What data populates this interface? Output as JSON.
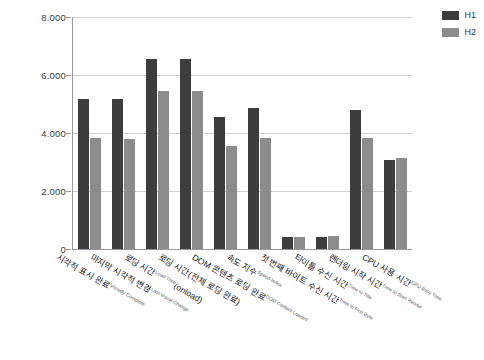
{
  "chart_data": {
    "type": "bar",
    "title": "",
    "subtitle": "",
    "xlabel": "",
    "ylabel": "",
    "ylim": [
      0,
      8000
    ],
    "ytick_labels": [
      "8.000",
      "6.000",
      "4.000",
      "2.000",
      "0"
    ],
    "ytick_values": [
      8000,
      6000,
      4000,
      2000,
      0
    ],
    "grid": true,
    "legend_position": "top-right",
    "categories": [
      "시각적 표시 완료",
      "마지막 시각적 변경",
      "로딩 시간",
      "로딩 시간(전체 로딩 완료)",
      "DOM 콘텐츠 로딩 완료",
      "속도 지수",
      "첫 번째 바이트 수신 시간",
      "타이틀 수신 시간",
      "렌더링 시작 시간",
      "CPU 사용 시간"
    ],
    "categories_en": [
      "Visually Complete",
      "Last Visual Change",
      "Load Time(onload)",
      "",
      "DOM Content Loaded",
      "Speed Index",
      "Time to First Byte",
      "Time to Title",
      "Time to Start Render",
      "CPU Busy Time"
    ],
    "category_labels": [
      {
        "ko": "시각적 표시 완료",
        "en": "Visually Complete"
      },
      {
        "ko": "마지막 시각적 변경",
        "en": "Last Visual Change"
      },
      {
        "ko": "로딩 시간",
        "en": "Load Time",
        "ko2": "(onload)"
      },
      {
        "ko": "로딩 시간(전체 로딩 완료)",
        "en": ""
      },
      {
        "ko": "DOM 콘텐츠 로딩 완료",
        "en": "DOM Content Loaded"
      },
      {
        "ko": "속도 지수",
        "en": "Speed Index"
      },
      {
        "ko": "첫 번째 바이트 수신 시간",
        "en": "Time to First Byte"
      },
      {
        "ko": "타이틀 수신 시간",
        "en": "Time to Title"
      },
      {
        "ko": "렌더링 시작 시간",
        "en": "Time to Start Render"
      },
      {
        "ko": "CPU 사용 시간",
        "en": "CPU Busy Time"
      }
    ],
    "series": [
      {
        "name": "H1",
        "color": "#3d3d3d",
        "values": [
          5170,
          5170,
          6550,
          6550,
          4550,
          4860,
          420,
          430,
          4800,
          3060
        ]
      },
      {
        "name": "H2",
        "color": "#8c8c8c",
        "values": [
          3830,
          3800,
          5450,
          5450,
          3550,
          3830,
          430,
          440,
          3820,
          3150
        ]
      }
    ]
  },
  "legend": {
    "items": [
      {
        "label": "H1",
        "color": "#3d3d3d"
      },
      {
        "label": "H2",
        "color": "#8c8c8c"
      }
    ]
  },
  "colors": {
    "series_h1": "#3d3d3d",
    "series_h2": "#8c8c8c",
    "gridline": "#d0d0d0",
    "axis": "#9a9a9a",
    "background": "#ffffff",
    "tick_text": "#3a3a3a"
  }
}
